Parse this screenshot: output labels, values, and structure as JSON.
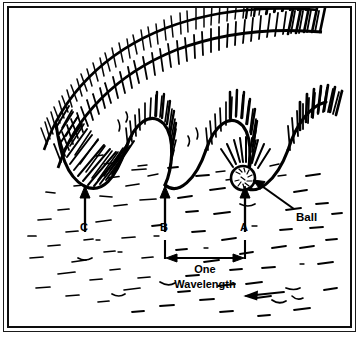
{
  "figure": {
    "kind": "hand-drawn-ink-illustration",
    "background_color": "#ffffff",
    "ink_color": "#000000",
    "frame": {
      "style": "double-rule-border",
      "outer_color": "#1a1a1a",
      "inner_color": "#0d0d0d"
    }
  },
  "labels": {
    "trough_c": "C",
    "trough_b": "B",
    "trough_a": "A",
    "ball": "Ball",
    "wavelength_line1": "One",
    "wavelength_line2": "Wavelength"
  },
  "diagram_data": {
    "type": "waveform-illustration",
    "wave": {
      "trough_positions_px": [
        85,
        165,
        245
      ],
      "crest_positions_px": [
        125,
        205,
        285
      ],
      "trough_baseline_y_px": 186,
      "crest_y_px": 150,
      "wave_count": 3,
      "breaking_crests": true,
      "hatching": "dense vertical pen strokes on crest faces"
    },
    "ball": {
      "center_x_px": 243,
      "center_y_px": 178,
      "radius_px": 12,
      "resting_in": "trough A"
    },
    "markers": [
      {
        "label": "C",
        "x_px": 85,
        "arrow": "up",
        "arrow_top_y_px": 186,
        "arrow_bottom_y_px": 232
      },
      {
        "label": "B",
        "x_px": 165,
        "arrow": "up",
        "arrow_top_y_px": 186,
        "arrow_bottom_y_px": 232
      },
      {
        "label": "A",
        "x_px": 245,
        "arrow": "up",
        "arrow_top_y_px": 186,
        "arrow_bottom_y_px": 232
      }
    ],
    "wavelength_measure": {
      "from_marker": "B",
      "to_marker": "A",
      "from_x_px": 165,
      "to_x_px": 245,
      "y_px": 258,
      "arrow_heads": "both",
      "caption": "One Wavelength"
    },
    "ball_callout": {
      "arrow_from_px": [
        292,
        210
      ],
      "arrow_to_px": [
        252,
        182
      ],
      "arrow_heads": "one",
      "text": "Ball"
    },
    "water_texture": {
      "style": "scattered short horizontal dashes",
      "region": "below wave line, filling lower half"
    },
    "current_arrow": {
      "direction": "left",
      "x_px": 262,
      "y_px": 293
    }
  }
}
